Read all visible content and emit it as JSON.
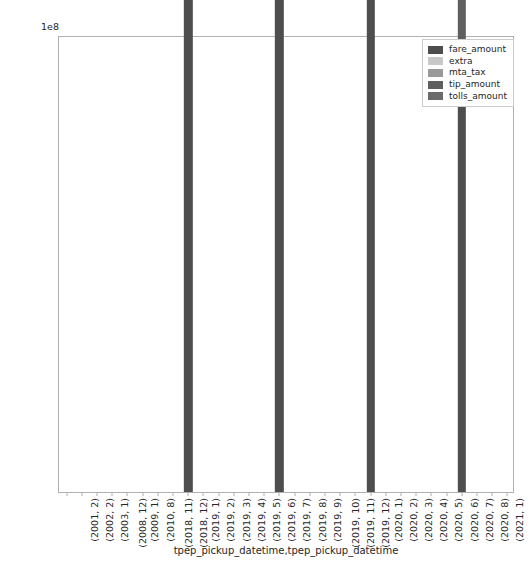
{
  "chart_data": {
    "type": "bar",
    "subtype": "stacked-bar",
    "title": "",
    "xlabel": "tpep_pickup_datetime,tpep_pickup_datetime",
    "ylabel": "",
    "y_exponent_label": "1e8",
    "y_exponent_value": 100000000,
    "ylim": [
      0,
      12600000
    ],
    "ylim_scaled": [
      0,
      1.26
    ],
    "grid": false,
    "legend_position": "upper right",
    "yticks": [
      "0.2",
      "0.4",
      "0.6",
      "0.8",
      "1.0",
      "1.2"
    ],
    "ytick_values": [
      0.2,
      0.4,
      0.6,
      0.8,
      1.0,
      1.2
    ],
    "categories": [
      "(2001, 2)",
      "(2002, 2)",
      "(2003, 1)",
      "(2008, 12)",
      "(2009, 1)",
      "(2010, 8)",
      "(2018, 11)",
      "(2018, 12)",
      "(2019, 1)",
      "(2019, 2)",
      "(2019, 3)",
      "(2019, 4)",
      "(2019, 5)",
      "(2019, 6)",
      "(2019, 7)",
      "(2019, 8)",
      "(2019, 9)",
      "(2019, 10)",
      "(2019, 11)",
      "(2019, 12)",
      "(2020, 1)",
      "(2020, 2)",
      "(2020, 3)",
      "(2020, 4)",
      "(2020, 5)",
      "(2020, 6)",
      "(2020, 7)",
      "(2020, 8)",
      "(2021, 1)",
      "(2088, 1)"
    ],
    "series": [
      {
        "name": "fare_amount",
        "color": "#4e4e4e",
        "values": [
          0,
          0,
          0,
          0,
          0,
          0,
          0,
          0,
          95500000,
          0,
          0,
          0,
          0,
          0,
          86000000,
          0,
          0,
          0,
          0,
          0,
          81000000,
          0,
          0,
          0,
          0,
          0,
          11200000,
          0,
          0,
          0
        ]
      },
      {
        "name": "extra",
        "color": "#c8c8c8",
        "values": [
          0,
          0,
          0,
          0,
          0,
          0,
          0,
          0,
          4200000,
          0,
          0,
          0,
          0,
          0,
          4500000,
          0,
          0,
          0,
          0,
          0,
          4600000,
          0,
          0,
          0,
          0,
          0,
          600000,
          0,
          0,
          0
        ]
      },
      {
        "name": "mta_tax",
        "color": "#9a9a9a",
        "values": [
          0,
          0,
          0,
          0,
          0,
          0,
          0,
          0,
          2900000,
          0,
          0,
          0,
          0,
          0,
          3000000,
          0,
          0,
          0,
          0,
          0,
          3100000,
          0,
          0,
          0,
          0,
          0,
          400000,
          0,
          0,
          0
        ]
      },
      {
        "name": "tip_amount",
        "color": "#5f5f5f",
        "values": [
          0,
          0,
          0,
          0,
          0,
          0,
          0,
          0,
          11400000,
          0,
          0,
          0,
          0,
          0,
          14500000,
          0,
          0,
          0,
          0,
          0,
          13500000,
          0,
          0,
          0,
          0,
          0,
          1400000,
          0,
          0,
          0
        ]
      },
      {
        "name": "tolls_amount",
        "color": "#6b6b6b",
        "values": [
          0,
          0,
          0,
          0,
          0,
          0,
          0,
          0,
          4000000,
          0,
          0,
          0,
          0,
          0,
          5500000,
          0,
          0,
          0,
          0,
          0,
          6600000,
          0,
          0,
          0,
          0,
          0,
          400000,
          0,
          0,
          0
        ]
      }
    ],
    "bar_totals": [
      0,
      0,
      0,
      0,
      0,
      0,
      0,
      0,
      118000000,
      0,
      0,
      0,
      0,
      0,
      113500000,
      0,
      0,
      0,
      0,
      0,
      108800000,
      0,
      0,
      0,
      0,
      0,
      14000000,
      0,
      0,
      0
    ]
  },
  "legend": {
    "entries": [
      {
        "label": "fare_amount"
      },
      {
        "label": "extra"
      },
      {
        "label": "mta_tax"
      },
      {
        "label": "tip_amount"
      },
      {
        "label": "tolls_amount"
      }
    ]
  }
}
